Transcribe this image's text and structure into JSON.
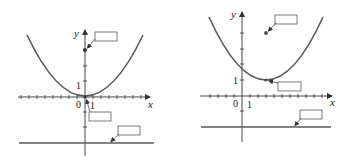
{
  "colors": {
    "curve": "#5a5a5a",
    "axis": "#333333",
    "directrix": "#5a5a5a",
    "box_border": "#444444",
    "background": "#ffffff"
  },
  "figures": [
    {
      "id": "left",
      "axis_labels": {
        "x": "x",
        "y": "y"
      },
      "tick_labels": {
        "origin": "0",
        "x_one": "1",
        "y_one": "1"
      },
      "curve": "parabola x^2 = 12y",
      "vertex": [
        0,
        0
      ],
      "focus": [
        0,
        3
      ],
      "directrix": "y = -3",
      "label_boxes": [
        {
          "name": "focus-label-box",
          "text": ""
        },
        {
          "name": "vertex-label-box",
          "text": ""
        },
        {
          "name": "directrix-label-box",
          "text": ""
        }
      ]
    },
    {
      "id": "right",
      "axis_labels": {
        "x": "x",
        "y": "y"
      },
      "tick_labels": {
        "origin": "0",
        "x_one": "1",
        "y_one": "1"
      },
      "curve": "parabola (x-3)^2 = 12(y-1)",
      "vertex": [
        3,
        1
      ],
      "focus": [
        3,
        4
      ],
      "directrix": "y = -2",
      "label_boxes": [
        {
          "name": "focus-label-box",
          "text": ""
        },
        {
          "name": "vertex-label-box",
          "text": ""
        },
        {
          "name": "directrix-label-box",
          "text": ""
        }
      ]
    }
  ]
}
